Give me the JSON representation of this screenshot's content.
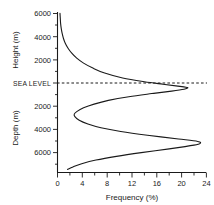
{
  "chart_data": {
    "type": "line",
    "title": "",
    "xlabel": "Frequency (%)",
    "ylabel_upper": "Height (m)",
    "ylabel_lower": "Depth (m)",
    "xlim": [
      0,
      24
    ],
    "ylim_elevation_m": [
      -6800,
      6000
    ],
    "grid": false,
    "legend": null,
    "annotations": [
      {
        "text": "SEA LEVEL",
        "elevation_m": 0,
        "style": "dashed-horizontal-line"
      }
    ],
    "xticks": [
      0,
      4,
      8,
      12,
      16,
      20,
      24
    ],
    "xtick_labels": [
      "0",
      "4",
      "8",
      "12",
      "16",
      "20",
      "24"
    ],
    "yticks_upper": [
      2000,
      4000,
      6000
    ],
    "ytick_labels_upper": [
      "2000",
      "4000",
      "6000"
    ],
    "yticks_lower": [
      2000,
      4000,
      6000
    ],
    "ytick_labels_lower": [
      "2000",
      "4000",
      "6000"
    ],
    "series": [
      {
        "name": "Hypsographic frequency curve",
        "description": "Frequency of Earth's solid surface elevation; bimodal with continental peak near sea level and abyssal peak near 4300 m depth",
        "points": [
          {
            "elevation_m": 6000,
            "frequency_pct": 0.4
          },
          {
            "elevation_m": 5600,
            "frequency_pct": 0.45
          },
          {
            "elevation_m": 5200,
            "frequency_pct": 0.5
          },
          {
            "elevation_m": 4800,
            "frequency_pct": 0.6
          },
          {
            "elevation_m": 4400,
            "frequency_pct": 0.75
          },
          {
            "elevation_m": 4000,
            "frequency_pct": 0.95
          },
          {
            "elevation_m": 3600,
            "frequency_pct": 1.25
          },
          {
            "elevation_m": 3200,
            "frequency_pct": 1.7
          },
          {
            "elevation_m": 2800,
            "frequency_pct": 2.3
          },
          {
            "elevation_m": 2400,
            "frequency_pct": 3.1
          },
          {
            "elevation_m": 2000,
            "frequency_pct": 4.2
          },
          {
            "elevation_m": 1600,
            "frequency_pct": 5.7
          },
          {
            "elevation_m": 1200,
            "frequency_pct": 7.6
          },
          {
            "elevation_m": 800,
            "frequency_pct": 10.5
          },
          {
            "elevation_m": 500,
            "frequency_pct": 14.0
          },
          {
            "elevation_m": 300,
            "frequency_pct": 17.0
          },
          {
            "elevation_m": 150,
            "frequency_pct": 19.4
          },
          {
            "elevation_m": 60,
            "frequency_pct": 20.7
          },
          {
            "elevation_m": 0,
            "frequency_pct": 21.0
          },
          {
            "elevation_m": -100,
            "frequency_pct": 20.4
          },
          {
            "elevation_m": -250,
            "frequency_pct": 18.4
          },
          {
            "elevation_m": -450,
            "frequency_pct": 15.2
          },
          {
            "elevation_m": -700,
            "frequency_pct": 11.5
          },
          {
            "elevation_m": -1000,
            "frequency_pct": 8.2
          },
          {
            "elevation_m": -1300,
            "frequency_pct": 5.9
          },
          {
            "elevation_m": -1600,
            "frequency_pct": 4.2
          },
          {
            "elevation_m": -1900,
            "frequency_pct": 3.1
          },
          {
            "elevation_m": -2100,
            "frequency_pct": 2.7
          },
          {
            "elevation_m": -2300,
            "frequency_pct": 2.8
          },
          {
            "elevation_m": -2600,
            "frequency_pct": 3.5
          },
          {
            "elevation_m": -2900,
            "frequency_pct": 4.9
          },
          {
            "elevation_m": -3200,
            "frequency_pct": 7.0
          },
          {
            "elevation_m": -3500,
            "frequency_pct": 10.2
          },
          {
            "elevation_m": -3800,
            "frequency_pct": 14.5
          },
          {
            "elevation_m": -4100,
            "frequency_pct": 19.5
          },
          {
            "elevation_m": -4300,
            "frequency_pct": 22.6
          },
          {
            "elevation_m": -4450,
            "frequency_pct": 23.0
          },
          {
            "elevation_m": -4600,
            "frequency_pct": 22.0
          },
          {
            "elevation_m": -4900,
            "frequency_pct": 18.0
          },
          {
            "elevation_m": -5200,
            "frequency_pct": 13.5
          },
          {
            "elevation_m": -5500,
            "frequency_pct": 9.5
          },
          {
            "elevation_m": -5800,
            "frequency_pct": 6.2
          },
          {
            "elevation_m": -6100,
            "frequency_pct": 3.9
          },
          {
            "elevation_m": -6350,
            "frequency_pct": 2.5
          },
          {
            "elevation_m": -6550,
            "frequency_pct": 1.6
          }
        ]
      }
    ]
  },
  "axes": {
    "x_title": "Frequency (%)",
    "y_title_upper": "Height (m)",
    "y_title_lower": "Depth (m)",
    "sea_level_label": "SEA LEVEL",
    "x_tick_0": "0",
    "x_tick_1": "4",
    "x_tick_2": "8",
    "x_tick_3": "12",
    "x_tick_4": "16",
    "x_tick_5": "20",
    "x_tick_6": "24",
    "y_up_tick_0": "2000",
    "y_up_tick_1": "4000",
    "y_up_tick_2": "6000",
    "y_lo_tick_0": "2000",
    "y_lo_tick_1": "4000",
    "y_lo_tick_2": "6000"
  },
  "colors": {
    "ink": "#1a1a1a",
    "background": "#ffffff"
  }
}
